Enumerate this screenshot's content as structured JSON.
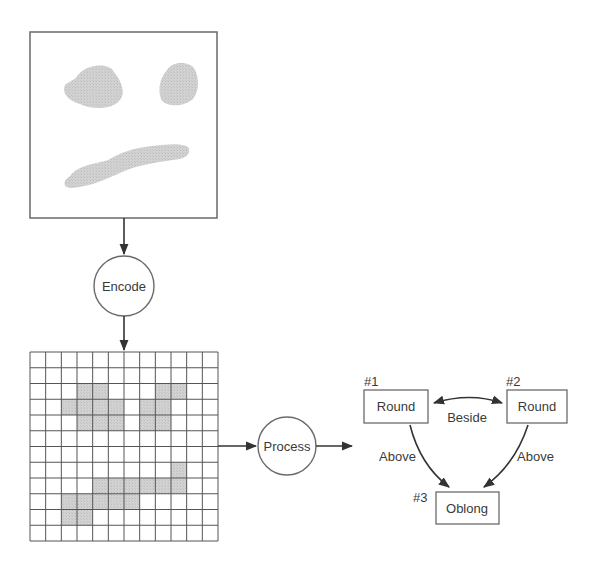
{
  "colors": {
    "stroke": "#4a4a4a",
    "shape_fill": "#cfcfcf",
    "cell_fill": "#d4d4d4",
    "grid_line": "#555555",
    "text": "#3a3a3a",
    "background": "#ffffff"
  },
  "image_panel": {
    "label": "input-image",
    "shapes": [
      "left-blob",
      "right-blob",
      "oblong-stroke"
    ]
  },
  "encode_node": {
    "label": "Encode"
  },
  "grid": {
    "rows": 12,
    "cols": 12,
    "shaded_cells": [
      [
        2,
        3
      ],
      [
        2,
        4
      ],
      [
        2,
        8
      ],
      [
        2,
        9
      ],
      [
        3,
        2
      ],
      [
        3,
        3
      ],
      [
        3,
        4
      ],
      [
        3,
        5
      ],
      [
        3,
        7
      ],
      [
        3,
        8
      ],
      [
        4,
        3
      ],
      [
        4,
        4
      ],
      [
        4,
        5
      ],
      [
        4,
        7
      ],
      [
        4,
        8
      ],
      [
        7,
        9
      ],
      [
        8,
        4
      ],
      [
        8,
        5
      ],
      [
        8,
        6
      ],
      [
        8,
        7
      ],
      [
        8,
        8
      ],
      [
        8,
        9
      ],
      [
        9,
        2
      ],
      [
        9,
        3
      ],
      [
        9,
        4
      ],
      [
        9,
        5
      ],
      [
        9,
        6
      ],
      [
        10,
        2
      ],
      [
        10,
        3
      ]
    ]
  },
  "process_node": {
    "label": "Process"
  },
  "relation_graph": {
    "nodes": [
      {
        "id": "#1",
        "label": "Round"
      },
      {
        "id": "#2",
        "label": "Round"
      },
      {
        "id": "#3",
        "label": "Oblong"
      }
    ],
    "edges": [
      {
        "from": "#1",
        "to": "#2",
        "label": "Beside",
        "bidirectional": true
      },
      {
        "from": "#1",
        "to": "#3",
        "label": "Above"
      },
      {
        "from": "#2",
        "to": "#3",
        "label": "Above"
      }
    ]
  }
}
